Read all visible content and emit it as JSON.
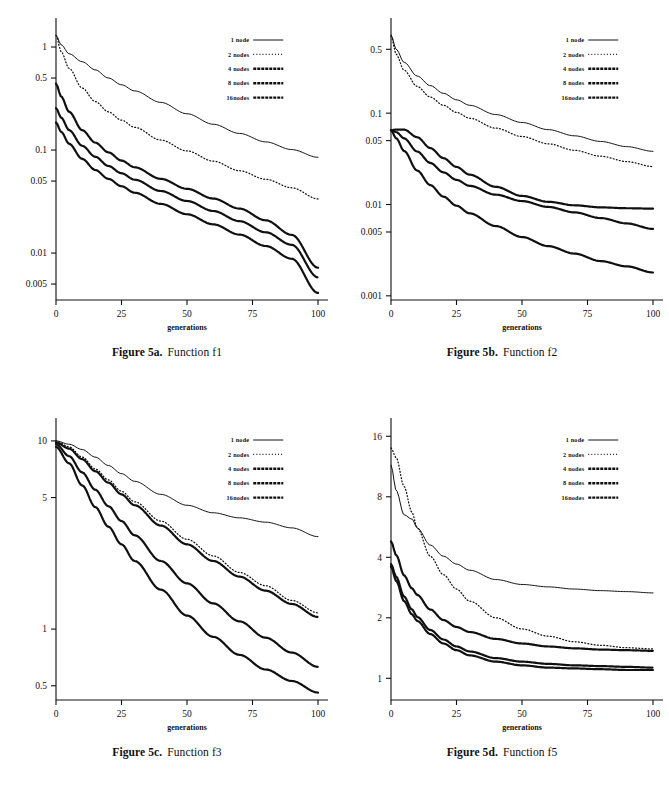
{
  "document": {
    "background_color": "#ffffff",
    "ink_color": "#101010",
    "figure_count": 4
  },
  "legend": {
    "entries": [
      {
        "label": "1 node",
        "style": "solid"
      },
      {
        "label": "2 nodes",
        "style": "dotted"
      },
      {
        "label": "4 nodes",
        "style": "dash-marker"
      },
      {
        "label": "8 nodes",
        "style": "dash-marker"
      },
      {
        "label": "16nodes",
        "style": "dash-marker"
      }
    ]
  },
  "panels": [
    {
      "id": "5a",
      "caption_figure": "Figure 5a.",
      "caption_function": "Function f1",
      "chart_data": {
        "type": "line",
        "title": "Function f1",
        "xlabel": "generations",
        "ylabel": "",
        "xscale": "linear",
        "yscale": "log",
        "xlim": [
          0,
          100
        ],
        "ylim": [
          0.0035,
          1.6
        ],
        "xticks": [
          0,
          25,
          50,
          75,
          100
        ],
        "xtick_labels": [
          "0",
          "25",
          "50",
          "75",
          "100"
        ],
        "yticks": [
          1,
          0.5,
          0.1,
          0.05,
          0.01,
          0.005
        ],
        "ytick_labels": [
          "1",
          "0.5",
          "0.1",
          "0.05",
          "0.01",
          "0.005"
        ],
        "grid": false,
        "legend_position": "upper-right",
        "x": [
          0,
          2,
          5,
          10,
          15,
          20,
          25,
          30,
          40,
          50,
          60,
          70,
          80,
          90,
          100
        ],
        "series": [
          {
            "name": "1 node",
            "style": "solid",
            "values": [
              1.3,
              1.05,
              0.86,
              0.72,
              0.6,
              0.5,
              0.43,
              0.375,
              0.29,
              0.225,
              0.178,
              0.145,
              0.12,
              0.101,
              0.085
            ]
          },
          {
            "name": "2 nodes",
            "style": "dotted",
            "values": [
              1.3,
              0.9,
              0.62,
              0.4,
              0.295,
              0.235,
              0.195,
              0.166,
              0.125,
              0.098,
              0.078,
              0.063,
              0.052,
              0.043,
              0.0335
            ]
          },
          {
            "name": "4 nodes",
            "style": "dash-marker",
            "values": [
              0.44,
              0.33,
              0.235,
              0.156,
              0.118,
              0.095,
              0.079,
              0.068,
              0.0525,
              0.042,
              0.0338,
              0.027,
              0.0208,
              0.015,
              0.0072
            ]
          },
          {
            "name": "8 nodes",
            "style": "dash-marker",
            "values": [
              0.255,
              0.206,
              0.156,
              0.11,
              0.086,
              0.07,
              0.0595,
              0.0515,
              0.04,
              0.032,
              0.0256,
              0.0204,
              0.0159,
              0.012,
              0.0058
            ]
          },
          {
            "name": "16nodes",
            "style": "dash-marker",
            "values": [
              0.185,
              0.15,
              0.115,
              0.082,
              0.064,
              0.0525,
              0.0445,
              0.0385,
              0.03,
              0.0238,
              0.019,
              0.0151,
              0.0117,
              0.0088,
              0.0041
            ]
          }
        ]
      }
    },
    {
      "id": "5b",
      "caption_figure": "Figure 5b.",
      "caption_function": "Function f2",
      "chart_data": {
        "type": "line",
        "title": "Function f2",
        "xlabel": "generations",
        "ylabel": "",
        "xscale": "linear",
        "yscale": "log",
        "xlim": [
          0,
          100
        ],
        "ylim": [
          0.0009,
          0.9
        ],
        "xticks": [
          0,
          25,
          50,
          75,
          100
        ],
        "xtick_labels": [
          "0",
          "25",
          "50",
          "75",
          "100"
        ],
        "yticks": [
          0.5,
          0.1,
          0.05,
          0.01,
          0.005,
          0.001
        ],
        "ytick_labels": [
          "0.5",
          "0.1",
          "0.05",
          "0.01",
          "0.005",
          "0.001"
        ],
        "grid": false,
        "legend_position": "upper-right",
        "x": [
          0,
          2,
          5,
          10,
          15,
          20,
          25,
          30,
          40,
          50,
          60,
          70,
          80,
          90,
          100
        ],
        "series": [
          {
            "name": "1 node",
            "style": "solid",
            "values": [
              0.72,
              0.5,
              0.36,
              0.255,
              0.2,
              0.165,
              0.14,
              0.122,
              0.0965,
              0.079,
              0.066,
              0.0565,
              0.049,
              0.043,
              0.0382
            ]
          },
          {
            "name": "2 nodes",
            "style": "dotted",
            "values": [
              0.7,
              0.44,
              0.295,
              0.196,
              0.15,
              0.122,
              0.102,
              0.088,
              0.0685,
              0.0555,
              0.0462,
              0.0392,
              0.0338,
              0.0295,
              0.026
            ]
          },
          {
            "name": "4 nodes",
            "style": "dash-marker",
            "values": [
              0.065,
              0.066,
              0.066,
              0.0545,
              0.0415,
              0.0322,
              0.0258,
              0.0212,
              0.0156,
              0.0124,
              0.0107,
              0.0098,
              0.0093,
              0.0091,
              0.009
            ]
          },
          {
            "name": "8 nodes",
            "style": "dash-marker",
            "values": [
              0.065,
              0.062,
              0.053,
              0.038,
              0.0285,
              0.0225,
              0.0186,
              0.016,
              0.0128,
              0.0109,
              0.0094,
              0.0082,
              0.0071,
              0.0062,
              0.0054
            ]
          },
          {
            "name": "16nodes",
            "style": "dash-marker",
            "values": [
              0.065,
              0.053,
              0.0385,
              0.0235,
              0.0163,
              0.0122,
              0.0097,
              0.008,
              0.0058,
              0.0044,
              0.0035,
              0.0029,
              0.0024,
              0.0021,
              0.0018
            ]
          }
        ]
      }
    },
    {
      "id": "5c",
      "caption_figure": "Figure 5c.",
      "caption_function": "Function f3",
      "chart_data": {
        "type": "line",
        "title": "Function f3",
        "xlabel": "generations",
        "ylabel": "",
        "xscale": "linear",
        "yscale": "log",
        "xlim": [
          0,
          100
        ],
        "ylim": [
          0.42,
          12
        ],
        "xticks": [
          0,
          25,
          50,
          75,
          100
        ],
        "xtick_labels": [
          "0",
          "25",
          "50",
          "75",
          "100"
        ],
        "yticks": [
          10,
          5,
          1,
          0.5
        ],
        "ytick_labels": [
          "10",
          "5",
          "1",
          "0.5"
        ],
        "grid": false,
        "legend_position": "upper-right",
        "x": [
          0,
          5,
          10,
          15,
          20,
          25,
          30,
          40,
          50,
          60,
          70,
          80,
          90,
          100
        ],
        "series": [
          {
            "name": "1 node",
            "style": "solid",
            "values": [
              10.0,
              9.6,
              9.0,
              8.2,
              7.4,
              6.7,
              6.1,
              5.2,
              4.55,
              4.15,
              3.9,
              3.7,
              3.45,
              3.1
            ]
          },
          {
            "name": "2 nodes",
            "style": "dotted",
            "values": [
              10.0,
              9.3,
              8.2,
              7.1,
              6.2,
              5.4,
              4.75,
              3.75,
              3.0,
              2.45,
              2.0,
              1.7,
              1.42,
              1.22
            ]
          },
          {
            "name": "4 nodes",
            "style": "dash-marker",
            "values": [
              9.8,
              9.1,
              8.0,
              6.9,
              6.0,
              5.2,
              4.55,
              3.55,
              2.82,
              2.3,
              1.9,
              1.6,
              1.36,
              1.16
            ]
          },
          {
            "name": "8 nodes",
            "style": "dash-marker",
            "values": [
              9.6,
              8.3,
              6.8,
              5.5,
              4.5,
              3.75,
              3.15,
              2.3,
              1.75,
              1.37,
              1.1,
              0.9,
              0.75,
              0.63
            ]
          },
          {
            "name": "16nodes",
            "style": "dash-marker",
            "values": [
              9.3,
              7.6,
              5.8,
              4.45,
              3.5,
              2.82,
              2.3,
              1.62,
              1.18,
              0.91,
              0.73,
              0.61,
              0.53,
              0.46
            ]
          }
        ]
      }
    },
    {
      "id": "5d",
      "caption_figure": "Figure 5d.",
      "caption_function": "Function f5",
      "chart_data": {
        "type": "line",
        "title": "Function f5",
        "xlabel": "generations",
        "ylabel": "",
        "xscale": "linear",
        "yscale": "log",
        "xlim": [
          0,
          100
        ],
        "ylim": [
          0.78,
          18
        ],
        "xticks": [
          0,
          25,
          50,
          75,
          100
        ],
        "xtick_labels": [
          "0",
          "25",
          "50",
          "75",
          "100"
        ],
        "yticks": [
          16,
          8,
          4,
          2,
          1
        ],
        "ytick_labels": [
          "16",
          "8",
          "4",
          "2",
          "1"
        ],
        "grid": false,
        "legend_position": "upper-right",
        "x": [
          0,
          2,
          5,
          8,
          10,
          15,
          20,
          25,
          30,
          40,
          50,
          60,
          70,
          80,
          90,
          100
        ],
        "series": [
          {
            "name": "1 node",
            "style": "solid",
            "values": [
              11.5,
              8.6,
              6.5,
              6.2,
              5.6,
              4.6,
              4.05,
              3.7,
              3.45,
              3.1,
              2.93,
              2.85,
              2.78,
              2.73,
              2.7,
              2.66
            ]
          },
          {
            "name": "2 nodes",
            "style": "dotted",
            "values": [
              14.0,
              12.5,
              9.0,
              6.7,
              5.6,
              4.05,
              3.28,
              2.78,
              2.42,
              2.0,
              1.76,
              1.62,
              1.52,
              1.46,
              1.42,
              1.4
            ]
          },
          {
            "name": "4 nodes",
            "style": "dash-marker",
            "values": [
              4.8,
              4.1,
              3.25,
              2.8,
              2.6,
              2.2,
              1.95,
              1.8,
              1.7,
              1.57,
              1.49,
              1.44,
              1.41,
              1.39,
              1.38,
              1.37
            ]
          },
          {
            "name": "8 nodes",
            "style": "dash-marker",
            "values": [
              3.7,
              3.2,
              2.55,
              2.2,
              2.02,
              1.74,
              1.56,
              1.44,
              1.36,
              1.26,
              1.21,
              1.18,
              1.16,
              1.15,
              1.14,
              1.13
            ]
          },
          {
            "name": "16nodes",
            "style": "dash-marker",
            "values": [
              3.6,
              3.05,
              2.42,
              2.08,
              1.93,
              1.66,
              1.49,
              1.38,
              1.3,
              1.21,
              1.16,
              1.13,
              1.12,
              1.11,
              1.1,
              1.1
            ]
          }
        ]
      }
    }
  ]
}
